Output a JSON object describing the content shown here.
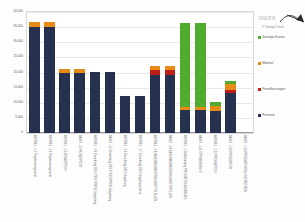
{
  "chart_data": {
    "type": "bar",
    "stacked": true,
    "title": "",
    "xlabel": "",
    "ylabel": "",
    "ylim": [
      0,
      40000
    ],
    "grid": true,
    "legend_position": "right",
    "ytick_labels": [
      "40.000",
      "35.000",
      "30.000",
      "25.000",
      "20.000",
      "15.000",
      "10.000",
      "5.000",
      "0"
    ],
    "ytick_values": [
      40000,
      35000,
      30000,
      25000,
      20000,
      15000,
      10000,
      5000,
      0
    ],
    "categories": [
      "ARTIKEL - 1.1 Projektmanagement",
      "ARTIKEL - 1.2 Projektmanagement",
      "ARTIKEL - 1.3 KONZEPTION",
      "BASIS - 1.2 KONZEPTION",
      "ARTIKEL - 1.4 Einrichtung DEV-/TEST-/PROD-Umgebung",
      "BASIS - 1.5 Einrichtung DEV-/TEST-/PROD-Umgebung",
      "ARTIKEL - 1.6 Einrichtung DEV-Umgebung",
      "ARTIKEL - 1.7 Einrichtung DEV-Umgebung Intern",
      "ARTIKEL - 1.8 DATENMIGRATION/SCHNITTSTELLEN",
      "BASIS - 1.9 DATENMIGRATION/SCHNITTSTELLEN",
      "ARTIKEL - 1.10 Anbindung PRODUKTIVUMGEBUNG",
      "BASIS - 1.11 OPTIMIERUNG E",
      "ARTIKEL - 1.12 PRODUKTION",
      "BASIS - 1.13 PRODUKTION",
      "BASIS - 1.14 PRODUKTIVROLLOUT/BETRIEB"
    ],
    "series": [
      {
        "name": "Personal",
        "color": "#25314f",
        "values": [
          35200,
          35200,
          19800,
          19800,
          20200,
          20200,
          12100,
          12100,
          19100,
          19100,
          7700,
          7700,
          7200,
          13200,
          0
        ]
      },
      {
        "name": "Fremdleistungen",
        "color": "#bf1e18",
        "values": [
          0,
          0,
          0,
          0,
          0,
          0,
          0,
          0,
          1900,
          1900,
          0,
          0,
          0,
          900,
          0
        ]
      },
      {
        "name": "Material",
        "color": "#e88a16",
        "values": [
          1600,
          1600,
          1300,
          1300,
          0,
          0,
          0,
          0,
          1100,
          1100,
          900,
          900,
          1700,
          2100,
          0
        ]
      },
      {
        "name": "Sonstige Kosten",
        "color": "#4fac2e",
        "values": [
          0,
          0,
          0,
          0,
          0,
          0,
          0,
          0,
          0,
          0,
          27900,
          27900,
          1400,
          1100,
          0
        ]
      }
    ]
  },
  "legend": {
    "items": [
      {
        "label": "Sonstige Kosten",
        "color": "#4fac2e",
        "swatch_class": "sw-sonstige"
      },
      {
        "label": "Material",
        "color": "#e88a16",
        "swatch_class": "sw-material"
      },
      {
        "label": "Fremdleistungen",
        "color": "#bf1e18",
        "swatch_class": "sw-fremd"
      },
      {
        "label": "Personal",
        "color": "#25314f",
        "swatch_class": "sw-personal"
      }
    ]
  },
  "branding": {
    "wordmark": "nuxx",
    "tagline": "IT Strategie Trends"
  }
}
